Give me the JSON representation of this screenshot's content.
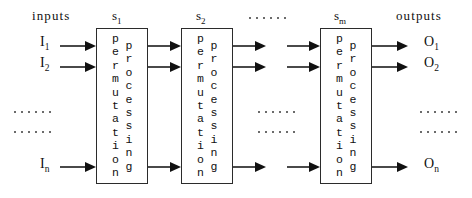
{
  "diagram": {
    "width": 472,
    "height": 198,
    "stroke_color": "#2b2b2b",
    "arrow_color": "#111111",
    "background": "#ffffff"
  },
  "header": {
    "inputs_label": "inputs",
    "outputs_label": "outputs",
    "stage_labels": [
      {
        "base": "s",
        "sub": "1"
      },
      {
        "base": "s",
        "sub": "2"
      },
      {
        "base": "s",
        "sub": "m"
      }
    ],
    "ellipsis": "......"
  },
  "inputs": [
    {
      "base": "I",
      "sub": "1"
    },
    {
      "base": "I",
      "sub": "2"
    },
    {
      "base": "I",
      "sub": "n"
    }
  ],
  "outputs": [
    {
      "base": "O",
      "sub": "1"
    },
    {
      "base": "O",
      "sub": "2"
    },
    {
      "base": "O",
      "sub": "n"
    }
  ],
  "stages": [
    {
      "id": "s1",
      "text_right": "processing",
      "text_left": "permutation"
    },
    {
      "id": "s2",
      "text_right": "processing",
      "text_left": "permutation"
    },
    {
      "id": "sm",
      "text_right": "processing",
      "text_left": "permutation"
    }
  ],
  "ellipsis_dot_count": 6
}
